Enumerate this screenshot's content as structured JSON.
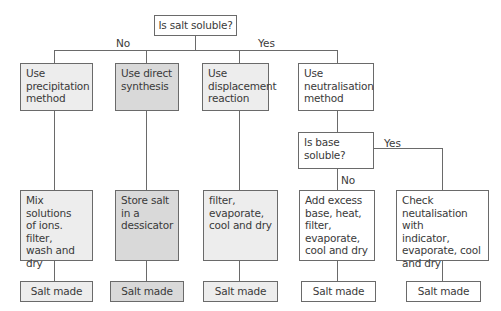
{
  "root": {
    "question": "Is salt soluble?"
  },
  "branch_labels": {
    "no": "No",
    "yes": "Yes"
  },
  "columns": [
    {
      "method": "Use\nprecipitation\nmethod",
      "steps": "Mix solutions\nof ions. filter,\nwash and dry",
      "result": "Salt made",
      "fill": "#ededed"
    },
    {
      "method": "Use direct\nsynthesis",
      "steps": "Store salt\nin a\ndessicator",
      "result": "Salt made",
      "fill": "#d9d9d9"
    },
    {
      "method": "Use\ndisplacement\nreaction",
      "steps": "filter,\nevaporate,\ncool and dry",
      "result": "Salt made",
      "fill": "#ededed"
    },
    {
      "method": "Use\nneutralisation\nmethod",
      "fill": "#ffffff"
    }
  ],
  "sub_decision": {
    "question": "Is base\nsoluble?",
    "no_label": "No",
    "yes_label": "Yes",
    "no_branch": {
      "steps": "Add excess\nbase, heat,\nfilter,\nevaporate,\ncool and dry",
      "result": "Salt made"
    },
    "yes_branch": {
      "steps": "Check\nneutalisation with\nindicator,\nevaporate, cool\nand dry",
      "result": "Salt made"
    }
  },
  "colors": {
    "line": "#6a6a6a",
    "fill_light": "#ededed",
    "fill_dark": "#d9d9d9",
    "text": "#3a3a3a"
  }
}
